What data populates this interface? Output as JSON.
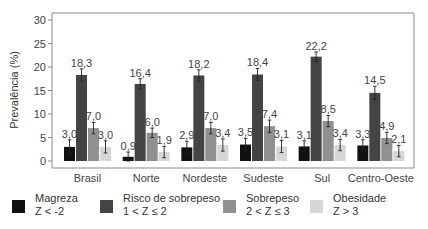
{
  "chart_data": {
    "type": "bar",
    "title": "",
    "xlabel": "",
    "ylabel": "Prevalência (%)",
    "ylim": [
      0,
      30
    ],
    "yticks": [
      0,
      5,
      10,
      15,
      20,
      25,
      30
    ],
    "grid": false,
    "error_bars": true,
    "legend_position": "bottom",
    "categories": [
      "Brasil",
      "Norte",
      "Nordeste",
      "Sudeste",
      "Sul",
      "Centro-Oeste"
    ],
    "series": [
      {
        "name": "Magreza",
        "sub": "Z < -2",
        "color": "#111111",
        "values": [
          3.0,
          0.9,
          2.9,
          3.5,
          3.1,
          3.3
        ],
        "labels": [
          "3,0",
          "0,9",
          "2,9",
          "3,5",
          "3,1",
          "3,3"
        ],
        "err": [
          1.5,
          1.0,
          1.3,
          1.3,
          1.2,
          1.2
        ]
      },
      {
        "name": "Risco de sobrepeso",
        "sub": "1 < Z ≤ 2",
        "color": "#444444",
        "values": [
          18.3,
          16.4,
          18.2,
          18.4,
          22.2,
          14.5
        ],
        "labels": [
          "18,3",
          "16,4",
          "18,2",
          "18,4",
          "22,2",
          "14,5"
        ],
        "err": [
          1.3,
          1.1,
          1.2,
          1.3,
          1.0,
          1.4
        ]
      },
      {
        "name": "Sobrepeso",
        "sub": "2 < Z ≤ 3",
        "color": "#909090",
        "values": [
          7.0,
          6.0,
          7.0,
          7.4,
          8.5,
          4.9
        ],
        "labels": [
          "7,0",
          "6,0",
          "7,0",
          "7,4",
          "8,5",
          "4,9"
        ],
        "err": [
          1.2,
          1.0,
          1.2,
          1.3,
          1.2,
          1.2
        ]
      },
      {
        "name": "Obesidade",
        "sub": "Z > 3",
        "color": "#d6d6d6",
        "values": [
          3.0,
          1.9,
          3.4,
          3.1,
          3.4,
          2.1
        ],
        "labels": [
          "3,0",
          "1,9",
          "3,4",
          "3,1",
          "3,4",
          "2,1"
        ],
        "err": [
          1.3,
          1.2,
          1.3,
          1.3,
          1.2,
          1.2
        ]
      }
    ]
  }
}
